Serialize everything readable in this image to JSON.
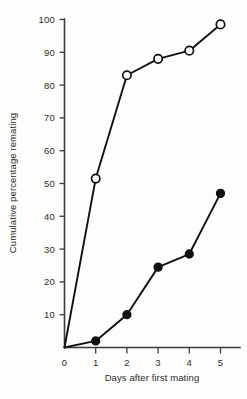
{
  "chart_data": {
    "type": "line",
    "title": "",
    "xlabel": "Days after first mating",
    "ylabel": "Cumulative percentage remating",
    "xlim": [
      0,
      5
    ],
    "ylim": [
      0,
      100
    ],
    "xticks": [
      "0",
      "1",
      "2",
      "3",
      "4",
      "5"
    ],
    "yticks": [
      "10",
      "20",
      "30",
      "40",
      "50",
      "60",
      "70",
      "80",
      "90",
      "100"
    ],
    "grid": false,
    "legend": "none",
    "x": [
      0,
      1,
      2,
      3,
      4,
      5
    ],
    "series": [
      {
        "name": "open-circle-series",
        "marker": "open-circle",
        "values": [
          0,
          51.5,
          83,
          88,
          90.5,
          98.5
        ]
      },
      {
        "name": "filled-circle-series",
        "marker": "filled-circle",
        "values": [
          0,
          2,
          10,
          24.5,
          28.5,
          47
        ]
      }
    ]
  },
  "colors": {
    "ink": "#111111",
    "axis": "#3a3a3a",
    "background": "#fdfdfb"
  }
}
